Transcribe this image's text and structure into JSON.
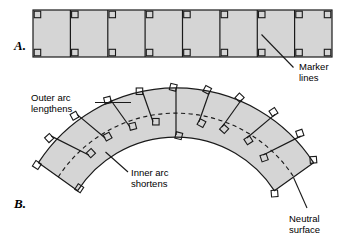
{
  "figure": {
    "background_color": "#ffffff",
    "fill_color": "#d5d5d5",
    "stroke_color": "#1a1a1a",
    "panels": [
      {
        "id": "A",
        "label": "A.",
        "description": "Straight bar marked with evenly spaced vertical marker lines",
        "segments": 8,
        "marker_lines": 9
      },
      {
        "id": "B",
        "label": "B.",
        "description": "Same bar bent into an arch; marker lines rotate and remain perpendicular to the neutral surface",
        "segments": 8,
        "marker_lines": 9
      }
    ],
    "annotations": [
      {
        "id": "marker-lines",
        "lines": [
          "Marker",
          "lines"
        ],
        "panel": "A"
      },
      {
        "id": "outer-arc-lengthens",
        "lines": [
          "Outer arc",
          "lengthens"
        ],
        "panel": "B"
      },
      {
        "id": "inner-arc-shortens",
        "lines": [
          "Inner arc",
          "shortens"
        ],
        "panel": "B"
      },
      {
        "id": "neutral-surface",
        "lines": [
          "Neutral",
          "surface"
        ],
        "panel": "B"
      }
    ]
  }
}
